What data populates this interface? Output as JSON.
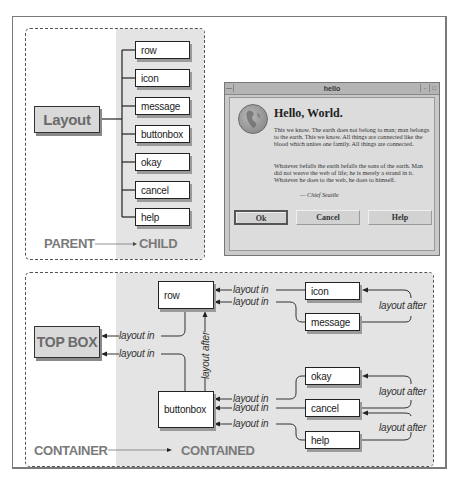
{
  "parent_child_diagram": {
    "parent_node": "Layout",
    "children": [
      "row",
      "icon",
      "message",
      "buttonbox",
      "okay",
      "cancel",
      "help"
    ],
    "caption_parent": "PARENT",
    "caption_child": "CHILD"
  },
  "hello_window": {
    "title": "hello",
    "heading": "Hello, World.",
    "paragraph1": "This we know.  The earth does not belong to man; man belongs to the earth.  This we know.  All things are connected like the blood which unites one family. All things are connected.",
    "paragraph2": "Whatever befalls the earth befalls the sons of the earth. Man did not weave the web of life; he is merely a strand in it.  Whatever he does to the web, he does to himself.",
    "signature": "— Chief Seattle",
    "buttons": {
      "ok": "Ok",
      "cancel": "Cancel",
      "help": "Help"
    },
    "icon": "globe-icon"
  },
  "container_diagram": {
    "top_box": "TOP BOX",
    "row": "row",
    "buttonbox": "buttonbox",
    "icon": "icon",
    "message": "message",
    "okay": "okay",
    "cancel": "cancel",
    "help": "help",
    "layout_in": "layout in",
    "layout_after": "layout after",
    "caption_container": "CONTAINER",
    "caption_contained": "CONTAINED"
  },
  "colors": {
    "panel_grey": "#e4e4e4",
    "node_border": "#222222",
    "big_box_fill": "#d9d9d9",
    "caption_text": "#7a7a7a"
  }
}
